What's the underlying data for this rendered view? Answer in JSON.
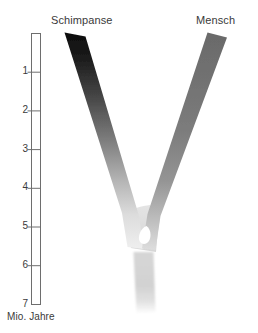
{
  "figure": {
    "background_color": "#ffffff",
    "width": 258,
    "height": 333
  },
  "labels": {
    "left_taxon": "Schimpanse",
    "right_taxon": "Mensch"
  },
  "axis": {
    "caption": "Mio. Jahre",
    "unit": "Mio. Jahre",
    "orientation": "vertical",
    "direction": "top-to-bottom-increasing",
    "range": [
      0,
      7
    ],
    "tick_values": [
      1,
      2,
      3,
      4,
      5,
      6,
      7
    ],
    "tick_labels": [
      "1",
      "2",
      "3",
      "4",
      "5",
      "6",
      "7"
    ],
    "bar_color": "#ffffff",
    "bar_outline_color": "#6e6e6e",
    "tick_color": "#6e6e6e",
    "text_color": "#3a3a3a"
  },
  "chart_data": {
    "type": "diagram",
    "subtype": "phylogenetic-divergence-y-shape",
    "xlabel": "",
    "ylabel": "Mio. Jahre",
    "ylim": [
      0,
      7
    ],
    "y_axis_inverted": true,
    "grid": false,
    "legend": "none",
    "tick_labels": [
      "1",
      "2",
      "3",
      "4",
      "5",
      "6",
      "7"
    ],
    "annotations": [
      "Schimpanse",
      "Mensch",
      "Mio. Jahre"
    ],
    "branches": [
      {
        "name": "Schimpanse",
        "label": "Schimpanse",
        "side": "left",
        "tip_age_mya": 0,
        "divergence_age_mya": 5.2,
        "tip_color": "#111111",
        "base_color": "#e8e8e8",
        "gradient": "dark-at-tip-to-light-at-root"
      },
      {
        "name": "Mensch",
        "label": "Mensch",
        "side": "right",
        "tip_age_mya": 0,
        "divergence_age_mya": 5.2,
        "tip_color": "#6b6b6b",
        "base_color": "#d8d8d8",
        "gradient": "medium-at-tip-to-light-at-root"
      },
      {
        "name": "Stamm",
        "label": "",
        "side": "center",
        "tip_age_mya": 5.2,
        "divergence_age_mya": 7.0,
        "tip_color": "#dcdcdc",
        "base_color": "#ffffff",
        "gradient": "light-fading-out-downward"
      }
    ],
    "divergence_point": {
      "age_mya": 5.2,
      "description": "Gabelung / letzter gemeinsamer Vorfahre"
    }
  }
}
